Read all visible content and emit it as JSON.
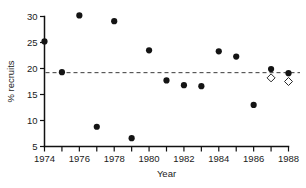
{
  "chart_data": {
    "type": "scatter",
    "title": "",
    "xlabel": "Year",
    "ylabel": "% recruits",
    "xlim": [
      1974,
      1988
    ],
    "ylim": [
      5,
      30
    ],
    "grid": false,
    "legend": null,
    "x_major_ticks": [
      1974,
      1976,
      1978,
      1980,
      1982,
      1984,
      1986,
      1988
    ],
    "x_major_tick_labels": [
      "1974",
      "1976",
      "1978",
      "1980",
      "1982",
      "1984",
      "1986",
      "1988"
    ],
    "x_minor_ticks": [
      1975,
      1977,
      1979,
      1981,
      1983,
      1985,
      1987
    ],
    "y_major_ticks": [
      5,
      10,
      15,
      20,
      25,
      30
    ],
    "y_major_tick_labels": [
      "5",
      "10",
      "15",
      "20",
      "25",
      "30"
    ],
    "reference_line": {
      "y": 19.2,
      "style": "dashed",
      "label": ""
    },
    "series": [
      {
        "name": "observed",
        "marker": "filled-circle",
        "color": "#141414",
        "points": [
          {
            "x": 1974,
            "y": 25.2
          },
          {
            "x": 1975,
            "y": 19.3
          },
          {
            "x": 1976,
            "y": 30.2
          },
          {
            "x": 1977,
            "y": 8.8
          },
          {
            "x": 1978,
            "y": 29.1
          },
          {
            "x": 1979,
            "y": 6.6
          },
          {
            "x": 1980,
            "y": 23.5
          },
          {
            "x": 1981,
            "y": 17.7
          },
          {
            "x": 1982,
            "y": 16.8
          },
          {
            "x": 1983,
            "y": 16.6
          },
          {
            "x": 1984,
            "y": 23.3
          },
          {
            "x": 1985,
            "y": 22.3
          },
          {
            "x": 1986,
            "y": 13.0
          },
          {
            "x": 1987,
            "y": 19.9
          },
          {
            "x": 1988,
            "y": 19.1
          }
        ]
      },
      {
        "name": "predicted",
        "marker": "open-diamond",
        "color": "#ffffff",
        "points": [
          {
            "x": 1987,
            "y": 18.2
          },
          {
            "x": 1988,
            "y": 17.5
          }
        ]
      }
    ]
  }
}
